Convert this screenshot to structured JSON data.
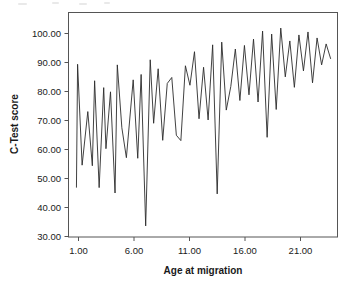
{
  "chart_data": {
    "type": "line",
    "title": "",
    "xlabel": "Age at migration",
    "ylabel": "C-Test score",
    "xlim": [
      0.3,
      24.0
    ],
    "ylim": [
      28.5,
      103.5
    ],
    "grid": false,
    "legend": null,
    "xticks": [
      1.0,
      6.0,
      11.0,
      16.0,
      21.0
    ],
    "xtick_labels": [
      "1.00",
      "6.00",
      "11.00",
      "16.00",
      "21.00"
    ],
    "yticks": [
      30.0,
      40.0,
      50.0,
      60.0,
      70.0,
      80.0,
      90.0,
      100.0
    ],
    "ytick_labels": [
      "30.00",
      "40.00",
      "50.00",
      "60.00",
      "70.00",
      "80.00",
      "90.00",
      "100.00"
    ],
    "series": [
      {
        "name": "C-Test score",
        "x": [
          1.0,
          1.1,
          1.5,
          2.0,
          2.4,
          2.6,
          3.0,
          3.4,
          3.6,
          4.0,
          4.4,
          4.6,
          5.0,
          5.4,
          6.0,
          6.4,
          6.7,
          7.1,
          7.5,
          7.8,
          8.2,
          8.6,
          9.0,
          9.4,
          9.8,
          10.2,
          10.6,
          11.0,
          11.4,
          11.8,
          12.2,
          12.6,
          13.0,
          13.4,
          13.8,
          14.2,
          14.6,
          15.0,
          15.4,
          15.8,
          16.2,
          16.6,
          17.0,
          17.4,
          17.8,
          18.2,
          18.6,
          19.0,
          19.4,
          19.8,
          20.2,
          20.6,
          21.0,
          21.4,
          21.8,
          22.2,
          22.6,
          23.0,
          23.4
        ],
        "y": [
          45.0,
          86.2,
          52.5,
          70.4,
          52.3,
          80.7,
          45.0,
          78.4,
          58.0,
          77.0,
          43.2,
          86.0,
          65.0,
          55.0,
          81.0,
          54.8,
          82.8,
          32.2,
          87.7,
          66.5,
          84.7,
          60.8,
          79.8,
          81.8,
          62.5,
          60.7,
          85.7,
          79.2,
          90.4,
          68.0,
          85.2,
          67.6,
          92.7,
          42.9,
          93.6,
          70.9,
          78.8,
          91.3,
          74.1,
          92.5,
          76.0,
          94.6,
          73.6,
          97.3,
          61.8,
          96.3,
          71.1,
          98.3,
          82.0,
          94.0,
          78.5,
          96.0,
          84.0,
          97.0,
          80.0,
          95.0,
          86.0,
          93.0,
          88.0
        ]
      }
    ]
  },
  "axes": {
    "x_title": "Age at migration",
    "y_title": "C-Test score"
  }
}
